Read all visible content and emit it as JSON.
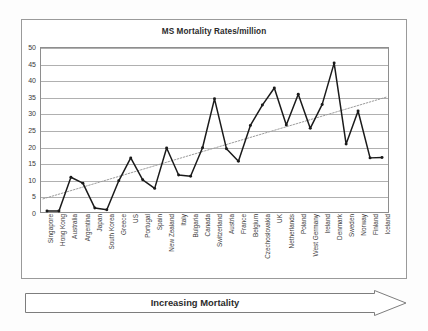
{
  "chart_data": {
    "type": "line",
    "title": "MS Mortality Rates/million",
    "xlabel": "",
    "ylabel": "",
    "ylim": [
      0,
      50
    ],
    "yticks": [
      0,
      5,
      10,
      15,
      20,
      25,
      30,
      35,
      40,
      45,
      50
    ],
    "grid": true,
    "legend": "none",
    "categories": [
      "Singapore",
      "Hong Kong",
      "Australia",
      "Argentina",
      "Japan",
      "South Korea",
      "Greece",
      "US",
      "Portugal",
      "Spain",
      "New Zealand",
      "Italy",
      "Bulgaria",
      "Canada",
      "Switzerland",
      "Austria",
      "France",
      "Belgium",
      "Czechoslovakia",
      "UK",
      "Netherlands",
      "Poland",
      "West Germany",
      "Ireland",
      "Denmark",
      "Sweden",
      "Norway",
      "Finland",
      "Iceland"
    ],
    "series": [
      {
        "name": "MS mortality rate per million",
        "values": [
          0.3,
          0.3,
          10.6,
          8.8,
          1.2,
          0.7,
          9.5,
          16.5,
          9.8,
          7.2,
          19.5,
          11.3,
          10.9,
          19.6,
          34.5,
          19.3,
          15.5,
          26.4,
          32.6,
          37.8,
          26.5,
          35.9,
          25.5,
          32.8,
          45.4,
          20.7,
          30.8,
          16.5,
          16.6
        ]
      }
    ],
    "trendline": {
      "name": "linear trend",
      "style": "dotted",
      "y_start": 4.0,
      "y_end": 35.0
    },
    "annotation": {
      "banner_label": "Increasing Mortality",
      "banner_shape": "right-arrow"
    },
    "colors": {
      "series_line": "#1a1a1a",
      "trendline": "#9b9b9b",
      "gridline": "#b0b0b0",
      "axis": "#8e8e8e",
      "text": "#2b2b2b",
      "background": "#ffffff"
    }
  }
}
